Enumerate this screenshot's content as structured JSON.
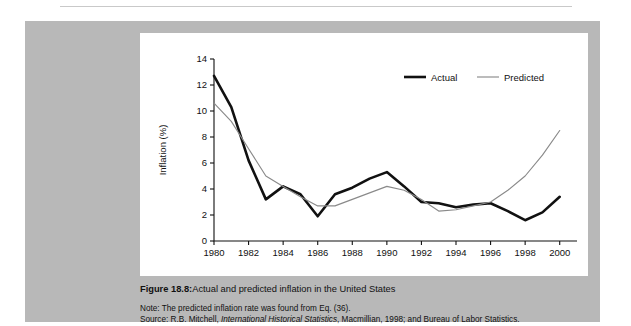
{
  "page": {
    "background_color": "#ffffff",
    "panel_color": "#b8b8b8",
    "card_color": "#ffffff"
  },
  "figure": {
    "label": "Figure 18.8:",
    "caption": "Actual and predicted inflation in the United States",
    "note_prefix": "Note:",
    "note_text": " The predicted inflation rate was found from Eq. (36).",
    "source_prefix": "Source:",
    "source_part1": " R.B. Mitchell, ",
    "source_italic": "International Historical Statistics",
    "source_part2": ", Macmillian, 1998; and Bureau of Labor Statistics."
  },
  "chart_data": {
    "type": "line",
    "title": "",
    "xlabel": "Year",
    "ylabel": "Inflation (%)",
    "xlim": [
      1980,
      2001
    ],
    "ylim": [
      0,
      14
    ],
    "xticks": [
      1980,
      1982,
      1984,
      1986,
      1988,
      1990,
      1992,
      1994,
      1996,
      1998,
      2000
    ],
    "yticks": [
      0,
      2,
      4,
      6,
      8,
      10,
      12,
      14
    ],
    "xtick_labels": [
      "1980",
      "1982",
      "1984",
      "1986",
      "1988",
      "1990",
      "1992",
      "1994",
      "1996",
      "1998",
      "2000"
    ],
    "ytick_labels": [
      "0",
      "2",
      "4",
      "6",
      "8",
      "10",
      "12",
      "14"
    ],
    "grid": false,
    "legend_position": "top-right",
    "x": [
      1980,
      1981,
      1982,
      1983,
      1984,
      1985,
      1986,
      1987,
      1988,
      1989,
      1990,
      1991,
      1992,
      1993,
      1994,
      1995,
      1996,
      1997,
      1998,
      1999,
      2000
    ],
    "series": [
      {
        "name": "Actual",
        "color": "#111111",
        "width": 2.6,
        "values": [
          12.7,
          10.3,
          6.2,
          3.2,
          4.2,
          3.6,
          1.9,
          3.6,
          4.1,
          4.8,
          5.3,
          4.2,
          3.0,
          2.9,
          2.6,
          2.8,
          2.9,
          2.3,
          1.6,
          2.2,
          3.4
        ]
      },
      {
        "name": "Predicted",
        "color": "#8a8a8a",
        "width": 1.15,
        "values": [
          10.6,
          9.2,
          7.1,
          5.0,
          4.2,
          3.4,
          2.7,
          2.7,
          3.2,
          3.7,
          4.2,
          3.9,
          3.2,
          2.3,
          2.4,
          2.7,
          3.0,
          3.9,
          5.0,
          6.6,
          8.5
        ]
      }
    ]
  },
  "legend": {
    "entries": [
      {
        "label": "Actual",
        "color": "#111111"
      },
      {
        "label": "Predicted",
        "color": "#8a8a8a"
      }
    ]
  }
}
